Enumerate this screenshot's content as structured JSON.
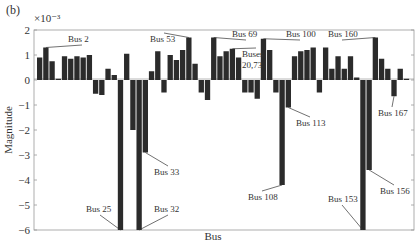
{
  "panel_label": "(b)",
  "chart_data": {
    "type": "bar",
    "title": "",
    "xlabel": "Bus",
    "ylabel": "Magnitude",
    "y_scale_note": "×10⁻³",
    "ylim": [
      -6,
      2
    ],
    "yticks": [
      2,
      1,
      0,
      -1,
      -2,
      -3,
      -4,
      -5,
      -6
    ],
    "grid": false,
    "legend": null,
    "bar_color": "#2b2b2b",
    "values": [
      0.9,
      1.3,
      0.75,
      0.05,
      0.95,
      0.85,
      0.95,
      0.9,
      1.0,
      -0.55,
      -0.6,
      0.45,
      0.2,
      -6.0,
      1.05,
      -2.0,
      -6.0,
      -2.9,
      0.35,
      1.15,
      -0.5,
      1.0,
      0.8,
      1.2,
      1.7,
      0.65,
      -0.5,
      -0.8,
      1.7,
      0.95,
      1.15,
      1.25,
      0.9,
      -0.5,
      -0.5,
      -0.75,
      1.65,
      1.2,
      -0.5,
      -4.2,
      -1.1,
      0.95,
      1.15,
      1.2,
      1.3,
      -0.5,
      1.3,
      0.45,
      0.95,
      0.45,
      0.95,
      0.1,
      -6.0,
      -3.6,
      1.7,
      0.85,
      0.45,
      -0.65,
      0.45,
      0.05
    ],
    "annotations": [
      {
        "text": "Bus 2",
        "bar_index": 1,
        "tx": 68,
        "ty": 42
      },
      {
        "text": "Bus 25",
        "bar_index": 13,
        "tx": 86,
        "ty": 212
      },
      {
        "text": "Bus 32",
        "bar_index": 16,
        "tx": 154,
        "ty": 212
      },
      {
        "text": "Bus 33",
        "bar_index": 17,
        "tx": 154,
        "ty": 175
      },
      {
        "text": "Bus 53",
        "bar_index": 24,
        "tx": 150,
        "ty": 42
      },
      {
        "text": "Bus 69",
        "bar_index": 28,
        "tx": 232,
        "ty": 37
      },
      {
        "text": "Buses",
        "bar_index": 31,
        "tx": 242,
        "ty": 57
      },
      {
        "text": "20,73",
        "bar_index": 31,
        "tx": 242,
        "ty": 68
      },
      {
        "text": "Bus 100",
        "bar_index": 36,
        "tx": 286,
        "ty": 37
      },
      {
        "text": "Bus 108",
        "bar_index": 39,
        "tx": 248,
        "ty": 200
      },
      {
        "text": "Bus 113",
        "bar_index": 40,
        "tx": 296,
        "ty": 126
      },
      {
        "text": "Bus 153",
        "bar_index": 52,
        "tx": 328,
        "ty": 202
      },
      {
        "text": "Bus 156",
        "bar_index": 53,
        "tx": 380,
        "ty": 194
      },
      {
        "text": "Bus 160",
        "bar_index": 54,
        "tx": 328,
        "ty": 37
      },
      {
        "text": "Bus 167",
        "bar_index": 57,
        "tx": 378,
        "ty": 116
      }
    ]
  }
}
